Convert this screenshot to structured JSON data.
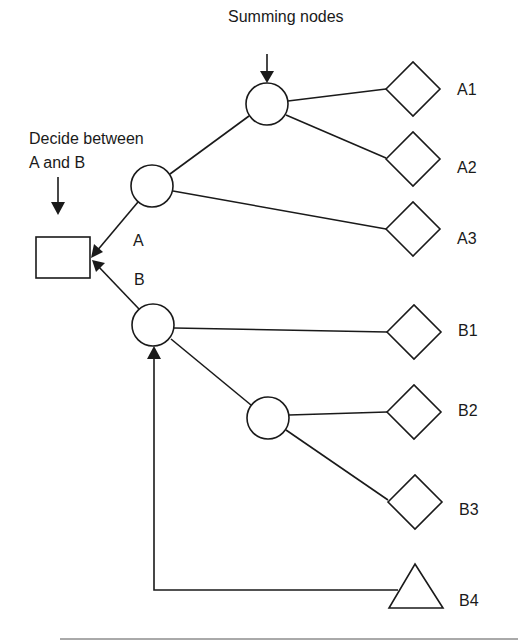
{
  "diagram": {
    "type": "decision-tree",
    "annotations": {
      "summing_nodes": "Summing nodes",
      "decide_line1": "Decide between",
      "decide_line2": "A and B"
    },
    "branch_labels": {
      "a": "A",
      "b": "B"
    },
    "nodes": {
      "decision": {
        "shape": "rectangle",
        "label": ""
      },
      "chance_a": {
        "shape": "circle",
        "label": ""
      },
      "chance_a_sub": {
        "shape": "circle",
        "label": ""
      },
      "chance_b": {
        "shape": "circle",
        "label": ""
      },
      "chance_b_sub": {
        "shape": "circle",
        "label": ""
      }
    },
    "outcomes": [
      {
        "id": "A1",
        "label": "A1",
        "shape": "diamond"
      },
      {
        "id": "A2",
        "label": "A2",
        "shape": "diamond"
      },
      {
        "id": "A3",
        "label": "A3",
        "shape": "diamond"
      },
      {
        "id": "B1",
        "label": "B1",
        "shape": "diamond"
      },
      {
        "id": "B2",
        "label": "B2",
        "shape": "diamond"
      },
      {
        "id": "B3",
        "label": "B3",
        "shape": "diamond"
      },
      {
        "id": "B4",
        "label": "B4",
        "shape": "triangle"
      }
    ],
    "edges": [
      {
        "from": "chance_a",
        "to": "decision",
        "label": "A",
        "arrow": true
      },
      {
        "from": "chance_b",
        "to": "decision",
        "label": "B",
        "arrow": true
      },
      {
        "from": "chance_a",
        "to": "chance_a_sub"
      },
      {
        "from": "chance_a_sub",
        "to": "A1"
      },
      {
        "from": "chance_a_sub",
        "to": "A2"
      },
      {
        "from": "chance_a",
        "to": "A3"
      },
      {
        "from": "chance_b",
        "to": "B1"
      },
      {
        "from": "chance_b",
        "to": "chance_b_sub"
      },
      {
        "from": "chance_b_sub",
        "to": "B2"
      },
      {
        "from": "chance_b_sub",
        "to": "B3"
      },
      {
        "from": "B4",
        "to": "chance_b",
        "arrow": true,
        "routing": "orthogonal"
      }
    ]
  }
}
